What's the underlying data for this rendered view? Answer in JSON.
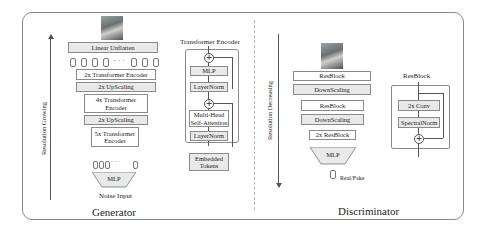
{
  "generator": {
    "title": "Generator",
    "axis_label": "Resolution Growing",
    "linear_unflatten": "Linear Unflatten",
    "blocks": [
      {
        "label": "2x Transformer Encoder"
      },
      {
        "label": "2x UpScaling"
      },
      {
        "label": "4x Transformer Encoder"
      },
      {
        "label": "2x UpScaling"
      },
      {
        "label": "5x Transformer Encoder"
      }
    ],
    "token_ellipsis": "· · ·",
    "mlp": "MLP",
    "input_label": "Noise Input"
  },
  "transformer_encoder": {
    "title": "Transformer Encoder",
    "mlp": "MLP",
    "layernorm_top": "LayerNorm",
    "attention": "Multi-Head Self-Attention",
    "layernorm_bottom": "LayerNorm",
    "input": "Embedded Tokens",
    "add_symbol": "+"
  },
  "discriminator": {
    "title": "Discriminator",
    "axis_label": "Resolution Decreasing",
    "blocks": [
      {
        "label": "ResBlock"
      },
      {
        "label": "DownScaling"
      },
      {
        "label": "ResBlock"
      },
      {
        "label": "DownScaling"
      },
      {
        "label": "2x ResBlock"
      }
    ],
    "mlp": "MLP",
    "output_label": "Real/Fake"
  },
  "resblock": {
    "title": "ResBlock",
    "conv": "2x Conv",
    "norm": "SpectralNorm",
    "add_symbol": "+"
  }
}
